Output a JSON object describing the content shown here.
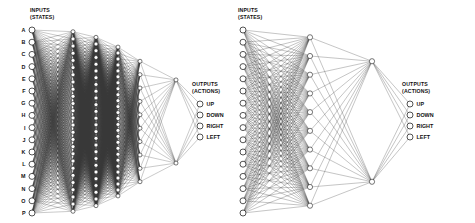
{
  "figure": {
    "type": "neural-network-diagram",
    "background_color": "#ffffff",
    "node_fill": "#ffffff",
    "node_stroke": "#1c1c1c",
    "edge_color": "#3a3a3a",
    "text_color": "#111111",
    "width": 475,
    "height": 223
  },
  "networks": [
    {
      "id": "left",
      "name": "deep-network",
      "input_caption_line1": "INPUTS",
      "input_caption_line2": "(STATES)",
      "output_caption_line1": "OUTPUTS",
      "output_caption_line2": "(ACTIONS)",
      "input_labels": [
        "A",
        "B",
        "C",
        "D",
        "E",
        "F",
        "G",
        "H",
        "I",
        "J",
        "K",
        "L",
        "M",
        "N",
        "O",
        "P"
      ],
      "output_labels": [
        "UP",
        "DOWN",
        "RIGHT",
        "LEFT"
      ],
      "layer_sizes": [
        16,
        26,
        26,
        26,
        10,
        2,
        4
      ],
      "layer_x": [
        32,
        73,
        96,
        118,
        140,
        176,
        200
      ],
      "input_top": 30,
      "input_bottom": 213,
      "caption_x": 30,
      "caption_y": 12,
      "output_caption_x": 192,
      "output_caption_y": 86,
      "output_top": 104,
      "output_spacing": 11,
      "node_radius": 3.0,
      "hidden_node_radius": 2.0,
      "edge_width": 0.32
    },
    {
      "id": "right",
      "name": "shallow-network",
      "input_caption_line1": "INPUTS",
      "input_caption_line2": "(STATES)",
      "output_caption_line1": "OUTPUTS",
      "output_caption_line2": "(ACTIONS)",
      "input_labels": [
        "",
        "",
        "",
        "",
        "",
        "",
        "",
        "",
        "",
        "",
        "",
        "",
        "",
        "",
        "",
        ""
      ],
      "output_labels": [
        "UP",
        "DOWN",
        "RIGHT",
        "LEFT"
      ],
      "layer_sizes": [
        16,
        10,
        2,
        4
      ],
      "layer_x": [
        243,
        310,
        372,
        410
      ],
      "input_top": 30,
      "input_bottom": 213,
      "caption_x": 238,
      "caption_y": 12,
      "output_caption_x": 402,
      "output_caption_y": 86,
      "output_top": 104,
      "output_spacing": 11,
      "node_radius": 3.0,
      "hidden_node_radius": 2.6,
      "edge_width": 0.35
    }
  ]
}
